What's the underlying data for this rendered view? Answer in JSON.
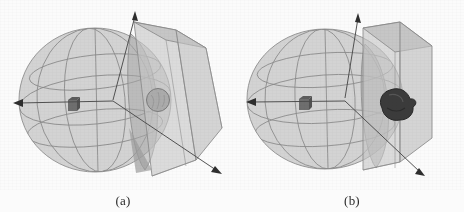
{
  "figure": {
    "background_color": "#fbfbfb",
    "panels": [
      {
        "id": "a",
        "caption": "(a)",
        "label_semantic": "subfigure-a-caption",
        "description": "3D head phantom: translucent gray ellipsoid with latitude/longitude wireframe, an oblique translucent rectangular slab intersecting the right side, a small dark cube marker near the center-left, a gray spherical inclusion on the slab face, and three coordinate axis arrows (up, left, lower-right).",
        "elements": {
          "ellipsoid": {
            "name": "head-ellipsoid",
            "fill_color": "#c9c9c9",
            "wire_color": "#8d8d8d",
            "center": [
              95,
              100
            ],
            "rx": 76,
            "ry": 72
          },
          "slab": {
            "name": "detector-slab",
            "fill_color": "#c4c4c4",
            "edge_color": "#8a8a8a",
            "orientation": "oblique-tilted"
          },
          "cube_marker": {
            "name": "source-cube-marker",
            "fill_color": "#6f6f6f",
            "position": [
              72,
              105
            ],
            "size": 10
          },
          "inclusion": {
            "name": "spherical-inclusion",
            "fill_color": "#a9a9a9",
            "edge_color": "#7d7d7d",
            "center": [
              158,
              100
            ],
            "radius": 11,
            "shape": "round-smooth"
          },
          "axes": [
            {
              "name": "axis-arrow-up",
              "from": [
                113,
                96
              ],
              "to": [
                135,
                12
              ]
            },
            {
              "name": "axis-arrow-left",
              "from": [
                113,
                101
              ],
              "to": [
                14,
                103
              ]
            },
            {
              "name": "axis-arrow-lower-right",
              "from": [
                113,
                101
              ],
              "to": [
                221,
                173
              ]
            }
          ]
        }
      },
      {
        "id": "b",
        "caption": "(b)",
        "label_semantic": "subfigure-b-caption",
        "description": "3D head phantom: translucent gray ellipsoid with latitude/longitude wireframe, a translucent rectangular slab standing at the right side, a small dark cube marker near the center, a dark irregular lesion/tumor blob on the slab face, and two coordinate axis arrows (up, left) plus a short lower-right marker.",
        "elements": {
          "ellipsoid": {
            "name": "head-ellipsoid",
            "fill_color": "#c9c9c9",
            "wire_color": "#8d8d8d",
            "center": [
              325,
              99
            ],
            "rx": 78,
            "ry": 70
          },
          "slab": {
            "name": "detector-slab",
            "fill_color": "#c4c4c4",
            "edge_color": "#8a8a8a",
            "orientation": "near-vertical"
          },
          "cube_marker": {
            "name": "source-cube-marker",
            "fill_color": "#6f6f6f",
            "position": [
              303,
              103
            ],
            "size": 10
          },
          "inclusion": {
            "name": "irregular-lesion-blob",
            "fill_color": "#3a3a3a",
            "edge_color": "#2a2a2a",
            "center": [
              396,
              103
            ],
            "radius": 15,
            "shape": "irregular-lobed"
          },
          "axes": [
            {
              "name": "axis-arrow-up",
              "from": [
                345,
                97
              ],
              "to": [
                358,
                14
              ]
            },
            {
              "name": "axis-arrow-left",
              "from": [
                345,
                101
              ],
              "to": [
                247,
                102
              ]
            },
            {
              "name": "axis-marker-lower-right",
              "from": [
                370,
                140
              ],
              "to": [
                425,
                178
              ]
            }
          ]
        }
      }
    ]
  }
}
